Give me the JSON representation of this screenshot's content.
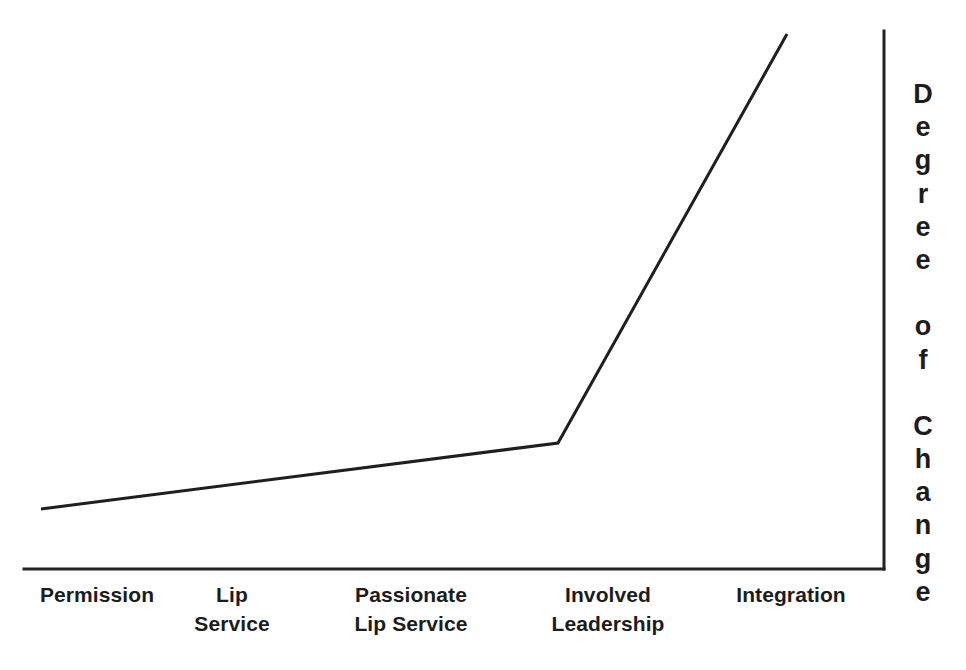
{
  "chart_data": {
    "type": "line",
    "title": "",
    "subtitle": "",
    "xlabel": "",
    "ylabel": "Degree of Change",
    "categories": [
      "Permission",
      "Lip\nService",
      "Passionate\nLip Service",
      "Involved\nLeadership",
      "Integration"
    ],
    "x": [
      1,
      2,
      3,
      4,
      5
    ],
    "values": [
      11,
      17,
      23,
      29,
      107
    ],
    "series": [
      {
        "name": "Degree of Change",
        "values": [
          11,
          17,
          23,
          29,
          107
        ]
      }
    ],
    "annotations": [],
    "legend": "none",
    "grid": false,
    "axis_ticks": false,
    "xlim": [
      0.9,
      5.3
    ],
    "ylim": [
      0,
      120
    ],
    "line_color": "#1f1f1f",
    "axis_color": "#232323",
    "background_color": "#ffffff"
  },
  "axes": {
    "x_axis_name": "stage-axis",
    "y_axis_name": "degree-of-change-axis",
    "y_axis_position": "right",
    "x_axis_position": "bottom"
  },
  "y_axis": {
    "label": "Degree of Change",
    "letters": [
      "D",
      "e",
      "g",
      "r",
      "e",
      "e",
      " ",
      "o",
      "f",
      " ",
      "C",
      "h",
      "a",
      "n",
      "g",
      "e"
    ]
  },
  "x_axis": {
    "labels": [
      {
        "text": "Permission",
        "center_x": 97,
        "lines": [
          "Permission"
        ]
      },
      {
        "text": "Lip Service",
        "center_x": 232,
        "lines": [
          "Lip",
          "Service"
        ]
      },
      {
        "text": "Passionate Lip Service",
        "center_x": 411,
        "lines": [
          "Passionate",
          "Lip Service"
        ]
      },
      {
        "text": "Involved Leadership",
        "center_x": 608,
        "lines": [
          "Involved",
          "Leadership"
        ]
      },
      {
        "text": "Integration",
        "center_x": 791,
        "lines": [
          "Integration"
        ]
      }
    ]
  },
  "geometry": {
    "x_axis_y": 569,
    "x_axis_start_x": 24,
    "x_axis_end_x": 884,
    "y_axis_x": 884,
    "y_axis_top_y": 31,
    "line_points": "41,509 558,443 787,34"
  },
  "colors": {
    "line": "#1f1f1f",
    "axis": "#232323",
    "text": "#1c1c1c",
    "background": "#ffffff"
  }
}
